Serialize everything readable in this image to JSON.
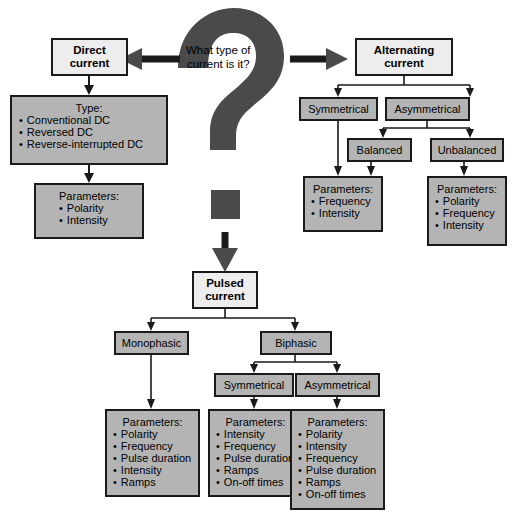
{
  "diagram": {
    "question": {
      "line1": "What type of",
      "line2": "current is it?"
    },
    "colors": {
      "box_fill": "#b4b4b4",
      "header_fill": "#ededed",
      "outline": "#1a1a1a",
      "qmark_fill": "#4a4a4a",
      "background": "#ffffff"
    },
    "branches": {
      "direct": {
        "header": {
          "line1": "Direct",
          "line2": "current"
        },
        "type_box": {
          "heading": "Type:",
          "items": [
            "Conventional DC",
            "Reversed DC",
            "Reverse-interrupted DC"
          ]
        },
        "parameters": {
          "heading": "Parameters:",
          "items": [
            "Polarity",
            "Intensity"
          ]
        }
      },
      "alternating": {
        "header": {
          "line1": "Alternating",
          "line2": "current"
        },
        "symmetrical": "Symmetrical",
        "asymmetrical": "Asymmetrical",
        "balanced": "Balanced",
        "unbalanced": "Unbalanced",
        "parameters_left": {
          "heading": "Parameters:",
          "items": [
            "Frequency",
            "Intensity"
          ]
        },
        "parameters_right": {
          "heading": "Parameters:",
          "items": [
            "Polarity",
            "Frequency",
            "Intensity"
          ]
        }
      },
      "pulsed": {
        "header": {
          "line1": "Pulsed",
          "line2": "current"
        },
        "monophasic": "Monophasic",
        "biphasic": "Biphasic",
        "symmetrical": "Symmetrical",
        "asymmetrical": "Asymmetrical",
        "parameters_monophasic": {
          "heading": "Parameters:",
          "items": [
            "Polarity",
            "Frequency",
            "Pulse duration",
            "Intensity",
            "Ramps"
          ]
        },
        "parameters_symmetrical": {
          "heading": "Parameters:",
          "items": [
            "Intensity",
            "Frequency",
            "Pulse duration",
            "Ramps",
            "On-off times"
          ]
        },
        "parameters_asymmetrical": {
          "heading": "Parameters:",
          "items": [
            "Polarity",
            "Intensity",
            "Frequency",
            "Pulse duration",
            "Ramps",
            "On-off times"
          ]
        }
      }
    }
  }
}
